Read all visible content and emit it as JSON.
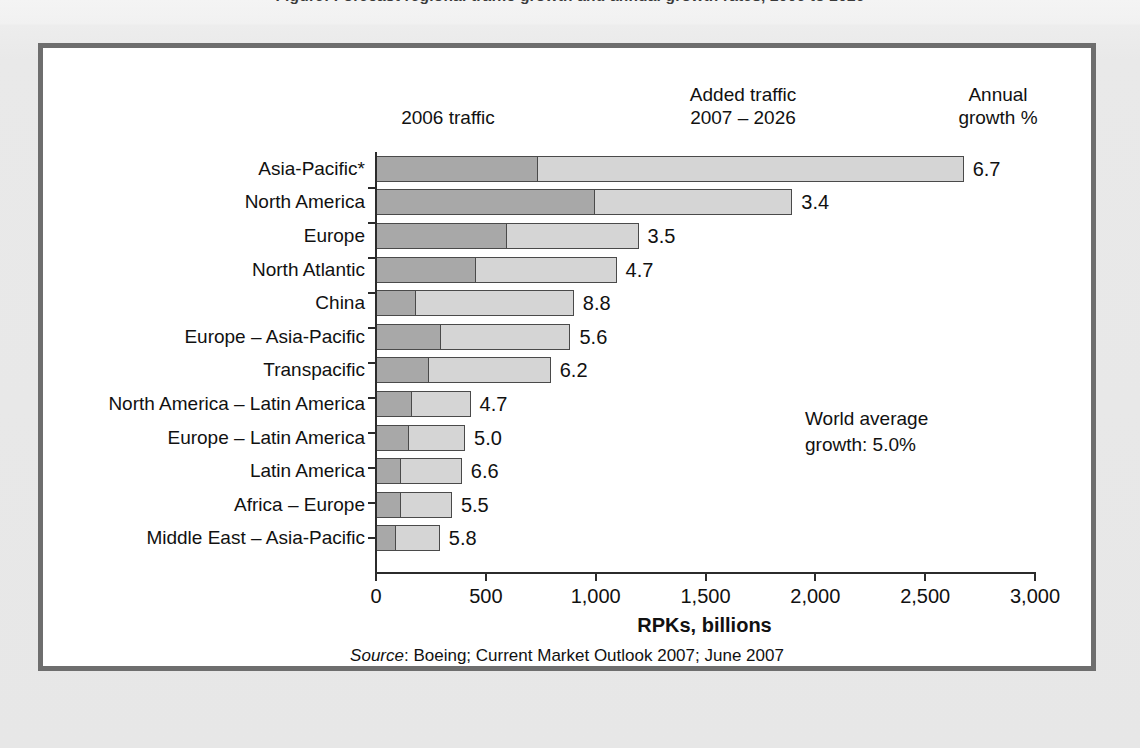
{
  "page": {
    "cut_caption": "Figure: Forecast regional traffic growth and annual growth rates, 2006 to 2026",
    "background_color": "#e9e9e9",
    "panel_color": "#ffffff",
    "frame_color": "#6e6e6e"
  },
  "headers": {
    "base_traffic": "2006 traffic",
    "added_traffic_line1": "Added traffic",
    "added_traffic_line2": "2007 – 2026",
    "growth_line1": "Annual",
    "growth_line2": "growth %"
  },
  "annotation": {
    "line1": "World average",
    "line2": "growth: 5.0%"
  },
  "axis": {
    "title": "RPKs, billions",
    "ticks": [
      "0",
      "500",
      "1,000",
      "1,500",
      "2,000",
      "2,500",
      "3,000"
    ]
  },
  "source": {
    "label": "Source",
    "text": ": Boeing; Current Market Outlook 2007; June 2007"
  },
  "colors": {
    "base_segment": "#a8a8a8",
    "added_segment": "#d5d5d5",
    "segment_outline": "#4a4a4a",
    "axis": "#2b2b2b"
  },
  "chart_data": {
    "type": "bar",
    "orientation": "horizontal",
    "stacked": true,
    "title": "",
    "xlabel": "RPKs, billions",
    "ylabel": "",
    "xlim": [
      0,
      3000
    ],
    "xticks": [
      0,
      500,
      1000,
      1500,
      2000,
      2500,
      3000
    ],
    "grid": false,
    "legend_position": "top-column-headers",
    "categories": [
      "Asia-Pacific*",
      "North America",
      "Europe",
      "North Atlantic",
      "China",
      "Europe – Asia-Pacific",
      "Transpacific",
      "North America – Latin America",
      "Europe – Latin America",
      "Latin America",
      "Africa – Europe",
      "Middle East – Asia-Pacific"
    ],
    "series": [
      {
        "name": "2006 traffic",
        "values": [
          740,
          1000,
          600,
          460,
          185,
          300,
          245,
          170,
          155,
          120,
          120,
          95
        ]
      },
      {
        "name": "Added traffic 2007 – 2026",
        "values": [
          1940,
          900,
          600,
          640,
          720,
          590,
          555,
          265,
          255,
          275,
          230,
          200
        ]
      }
    ],
    "totals": [
      2680,
      1900,
      1200,
      1100,
      905,
      890,
      800,
      435,
      410,
      395,
      350,
      295
    ],
    "annual_growth_percent": [
      6.7,
      3.4,
      3.5,
      4.7,
      8.8,
      5.6,
      6.2,
      4.7,
      5.0,
      6.6,
      5.5,
      5.8
    ],
    "growth_labels": [
      "6.7",
      "3.4",
      "3.5",
      "4.7",
      "8.8",
      "5.6",
      "6.2",
      "4.7",
      "5.0",
      "6.6",
      "5.5",
      "5.8"
    ],
    "world_average_growth": "5.0%",
    "annotations": [
      "World average growth: 5.0%"
    ]
  }
}
